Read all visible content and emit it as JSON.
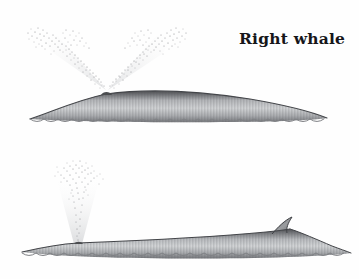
{
  "figure": {
    "type": "natural-history-illustration",
    "background_color": "#fefefe",
    "ink_color": "#16161a",
    "body_tone_dark": "#5f6063",
    "body_tone_mid": "#a9abae",
    "body_tone_light": "#e8e9ea",
    "spray_color": "#9a9ca0"
  },
  "panels": [
    {
      "id": "right-whale",
      "label": "Right whale",
      "label_position": {
        "x": 239,
        "y": 29
      },
      "blow": {
        "shape": "V-shaped double spout",
        "streams": 2,
        "origin": {
          "x": 106,
          "y": 89
        },
        "left_stream_tip": {
          "x": 33,
          "y": 30
        },
        "right_stream_tip": {
          "x": 182,
          "y": 28
        }
      },
      "body": {
        "dorsal_fin": "none",
        "back_profile": "smooth broad arch, finless",
        "snout_x": 30,
        "tail_tip_x": 327,
        "waterline_y": 121,
        "crest_y": 93
      }
    },
    {
      "id": "fin-whale",
      "label": "Fin whale",
      "label_position": {
        "x": 247,
        "y": 169
      },
      "blow": {
        "shape": "single tall narrow column",
        "streams": 1,
        "origin": {
          "x": 78,
          "y": 243
        },
        "plume_top_y": 166,
        "plume_spread_x": 44
      },
      "body": {
        "dorsal_fin": "prominent, backswept hooked fin set far back",
        "dorsal_fin_x": 283,
        "dorsal_fin_peak_y": 219,
        "back_profile": "long slender ridge with rear dorsal fin",
        "snout_x": 22,
        "tail_tip_x": 351,
        "waterline_y": 259,
        "crest_y": 243
      }
    }
  ]
}
